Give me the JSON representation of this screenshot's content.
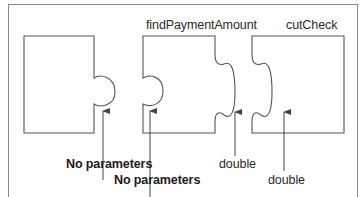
{
  "diagram": {
    "pieces": [
      {
        "id": "main",
        "title": "",
        "input_label": "No parameters"
      },
      {
        "id": "findPaymentAmount",
        "title": "findPaymentAmount",
        "input_label": "No parameters",
        "output_label": "double"
      },
      {
        "id": "cutCheck",
        "title": "cutCheck",
        "input_label": "double"
      }
    ],
    "labels": {
      "piece2_title": "findPaymentAmount",
      "piece3_title": "cutCheck",
      "arrow1_label": "No parameters",
      "arrow2_label": "No parameters",
      "arrow3_label": "double",
      "arrow4_label": "double"
    },
    "colors": {
      "stroke": "#555555",
      "frame": "#8a8a8a",
      "text": "#2a2a2a"
    }
  }
}
